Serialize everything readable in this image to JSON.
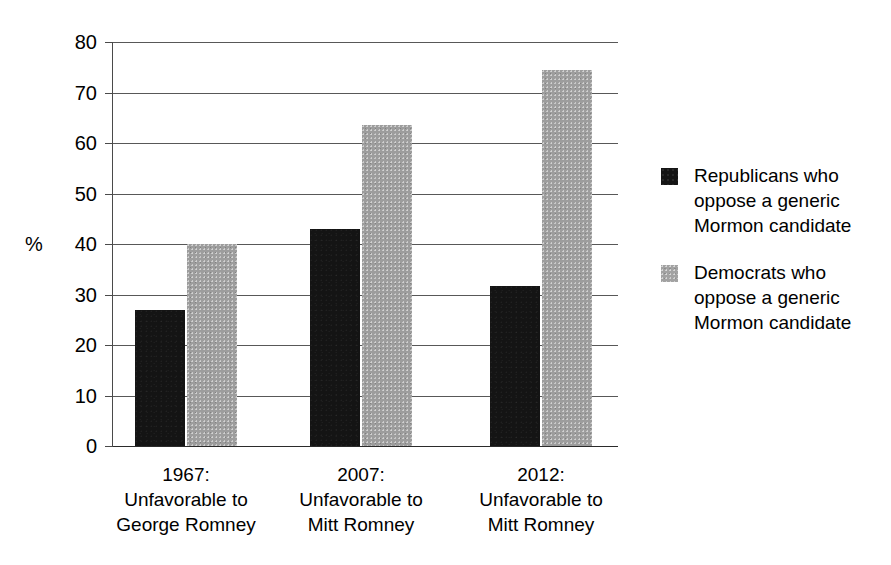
{
  "chart_data": {
    "type": "bar",
    "title": "",
    "subtitle": "",
    "xlabel": "",
    "ylabel": "%",
    "ylim": [
      0,
      80
    ],
    "ytick_step": 10,
    "yticks": [
      "80",
      "70",
      "60",
      "50",
      "40",
      "30",
      "20",
      "10",
      "0"
    ],
    "grid": true,
    "legend_position": "right",
    "categories": [
      {
        "lines": [
          "1967:",
          "Unfavorable to",
          "George Romney"
        ]
      },
      {
        "lines": [
          "2007:",
          "Unfavorable to",
          "Mitt Romney"
        ]
      },
      {
        "lines": [
          "2012:",
          "Unfavorable to",
          "Mitt Romney"
        ]
      }
    ],
    "series": [
      {
        "name": "Republicans who oppose a generic Mormon candidate",
        "legend_lines": [
          "Republicans who",
          "oppose a generic",
          "Mormon candidate"
        ],
        "color": "#141414",
        "values": [
          27,
          43,
          31.7
        ]
      },
      {
        "name": "Democrats who oppose a generic Mormon candidate",
        "legend_lines": [
          "Democrats who",
          "oppose a generic",
          "Mormon candidate"
        ],
        "color": "#9d9d9d",
        "values": [
          40,
          63.5,
          74.5
        ]
      }
    ]
  },
  "colors": {
    "republican_bar": "#141414",
    "democrat_bar": "#9d9d9d",
    "axis": "#4a4a4a",
    "gridline": "#585858",
    "background": "#ffffff"
  }
}
